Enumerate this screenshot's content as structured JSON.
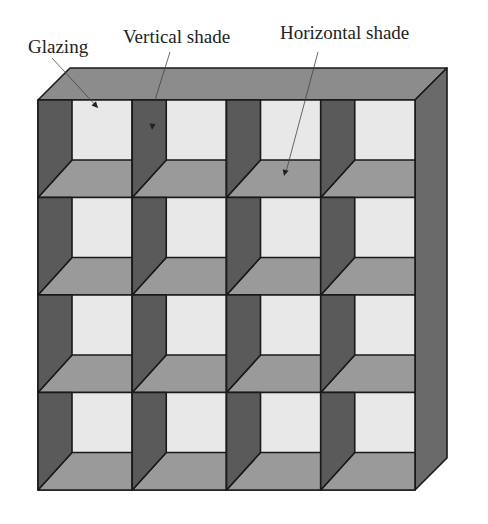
{
  "labels": {
    "glazing": "Glazing",
    "vertical_shade": "Vertical shade",
    "horizontal_shade": "Horizontal shade"
  },
  "grid": {
    "rows": 4,
    "cols": 4
  },
  "colors": {
    "glazing": "#e8e8e8",
    "vertical_shade": "#5a5a5a",
    "horizontal_shade": "#9a9a9a",
    "top_face": "#8c8c8c",
    "side_face": "#6a6a6a",
    "outline": "#1a1a1a"
  }
}
